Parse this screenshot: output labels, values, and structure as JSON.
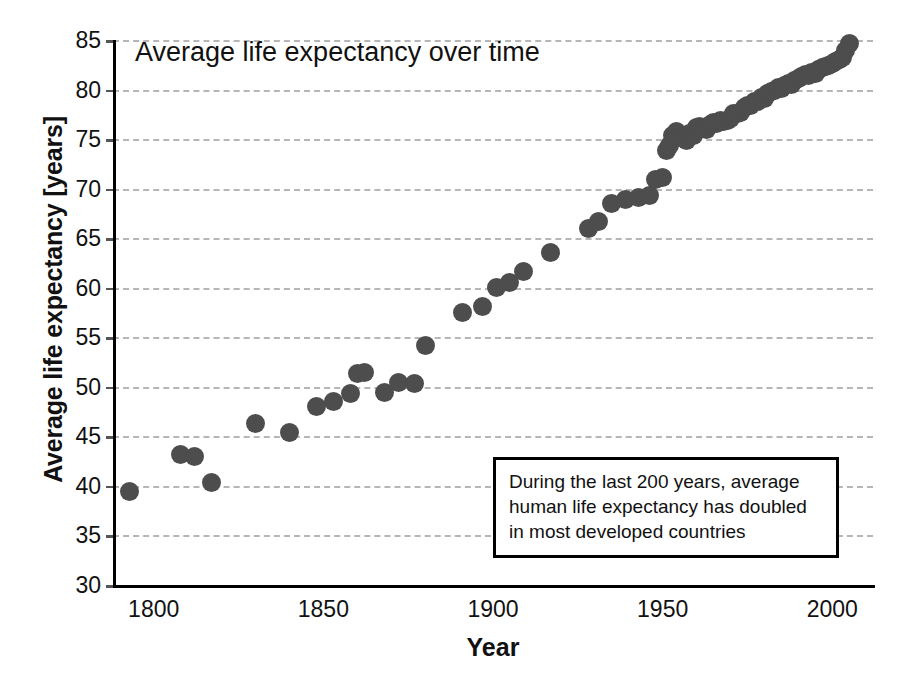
{
  "chart_data": {
    "type": "scatter",
    "title": "Average life expectancy over time",
    "xlabel": "Year",
    "ylabel": "Average life expectancy [years]",
    "xlim": [
      1788,
      2012
    ],
    "ylim": [
      30,
      85
    ],
    "xticks": [
      1800,
      1850,
      1900,
      1950,
      2000
    ],
    "yticks": [
      30,
      35,
      40,
      45,
      50,
      55,
      60,
      65,
      70,
      75,
      80,
      85
    ],
    "grid": "horizontal-dashed",
    "legend": "none",
    "marker_color": "#4d4d4d",
    "grid_color": "#b6b6b6",
    "axis_color": "#000000",
    "background_color": "#ffffff",
    "annotations": [
      {
        "text_lines": [
          "During the last 200 years, average",
          "human life expectancy has doubled",
          "in most developed countries"
        ]
      }
    ],
    "x": [
      1793,
      1808,
      1812,
      1817,
      1830,
      1840,
      1848,
      1853,
      1858,
      1860,
      1862,
      1868,
      1872,
      1877,
      1880,
      1891,
      1897,
      1901,
      1905,
      1909,
      1917,
      1928,
      1931,
      1935,
      1939,
      1943,
      1946,
      1948,
      1950,
      1951,
      1952,
      1953,
      1954,
      1955,
      1956,
      1957,
      1958,
      1959,
      1960,
      1961,
      1962,
      1963,
      1964,
      1965,
      1966,
      1967,
      1968,
      1969,
      1970,
      1971,
      1972,
      1973,
      1974,
      1975,
      1976,
      1977,
      1978,
      1979,
      1980,
      1981,
      1982,
      1983,
      1984,
      1985,
      1986,
      1987,
      1988,
      1989,
      1990,
      1991,
      1992,
      1993,
      1994,
      1995,
      1996,
      1997,
      1998,
      1999,
      2000,
      2001,
      2002,
      2003,
      2004,
      2005
    ],
    "y": [
      39.4,
      43.2,
      43.0,
      40.3,
      46.3,
      45.4,
      48.0,
      48.5,
      49.3,
      51.3,
      51.4,
      49.4,
      50.4,
      50.3,
      54.2,
      57.5,
      58.1,
      60.0,
      60.5,
      61.6,
      63.6,
      66.0,
      66.7,
      68.5,
      68.9,
      69.1,
      69.3,
      70.9,
      71.1,
      73.8,
      74.4,
      75.4,
      75.8,
      75.2,
      75.3,
      74.9,
      75.6,
      75.4,
      76.2,
      76.3,
      76.2,
      76.0,
      76.5,
      76.7,
      76.6,
      76.9,
      76.8,
      76.9,
      77.1,
      77.6,
      77.6,
      77.7,
      78.2,
      78.4,
      78.4,
      78.8,
      78.8,
      79.2,
      79.1,
      79.6,
      79.8,
      79.9,
      80.2,
      80.1,
      80.4,
      80.6,
      80.5,
      80.9,
      81.1,
      81.3,
      81.5,
      81.4,
      81.7,
      81.6,
      82.0,
      82.2,
      82.3,
      82.4,
      82.6,
      82.8,
      83.0,
      83.2,
      83.9,
      84.6
    ]
  },
  "axis": {
    "ytick_labels": [
      "85",
      "80",
      "75",
      "70",
      "65",
      "60",
      "55",
      "50",
      "45",
      "40",
      "35",
      "30"
    ],
    "xtick_labels": [
      "1800",
      "1850",
      "1900",
      "1950",
      "2000"
    ]
  },
  "annotation": {
    "line1": "During the last 200 years, average",
    "line2": "human life expectancy has doubled",
    "line3": "in most developed countries"
  }
}
